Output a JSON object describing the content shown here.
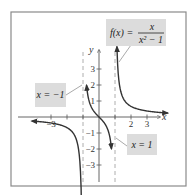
{
  "chart_data": {
    "type": "line",
    "title": "",
    "function_label": "f(x) = x / (x^2 - 1)",
    "function_parts": {
      "lhs": "f(x) =",
      "numerator": "x",
      "denominator": "x² − 1"
    },
    "xlabel": "x",
    "ylabel": "y",
    "xlim": [
      -4.5,
      5.5
    ],
    "ylim": [
      -4.3,
      4.8
    ],
    "grid": false,
    "x_ticks": [
      -3,
      -2,
      -1,
      1,
      2,
      3
    ],
    "x_tick_labels": [
      {
        "value": -3,
        "label": "−3"
      },
      {
        "value": 2,
        "label": "2"
      },
      {
        "value": 3,
        "label": "3"
      }
    ],
    "y_ticks": [
      -3,
      -2,
      -1,
      1,
      2,
      3
    ],
    "y_tick_labels": [
      {
        "value": 3,
        "label": "3"
      },
      {
        "value": 2,
        "label": "2"
      },
      {
        "value": 1,
        "label": "1"
      },
      {
        "value": -1,
        "label": "−1"
      },
      {
        "value": -2,
        "label": "−2"
      },
      {
        "value": -3,
        "label": "−3"
      }
    ],
    "asymptotes": [
      {
        "type": "vertical",
        "x": -1,
        "label": "x = −1"
      },
      {
        "type": "vertical",
        "x": 1,
        "label": "x = 1"
      },
      {
        "type": "horizontal",
        "y": 0
      }
    ],
    "series": [
      {
        "name": "left branch",
        "x_range": [
          -4.2,
          -1.08
        ]
      },
      {
        "name": "middle branch",
        "x_range": [
          -0.78,
          0.78
        ]
      },
      {
        "name": "right branch",
        "x_range": [
          1.12,
          4.3
        ]
      }
    ],
    "annotations": [
      {
        "text": "f(x) = x/(x²−1)",
        "points_to": "right branch"
      },
      {
        "text": "x = −1",
        "points_to": "asymptote x=-1"
      },
      {
        "text": "x = 1",
        "points_to": "asymptote x=1"
      }
    ]
  }
}
